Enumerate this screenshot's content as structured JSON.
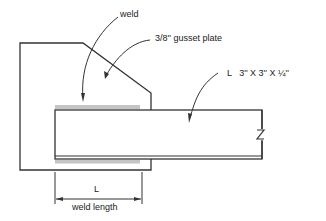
{
  "diagram": {
    "type": "engineering-detail",
    "labels": {
      "weld": "weld",
      "gusset_plate": "3/8'' gusset plate",
      "angle": "L   3'' X 3'' X ¼''",
      "dimension_symbol": "L",
      "dimension_caption": "weld length"
    },
    "symbols": {
      "break_mark": "Z"
    },
    "colors": {
      "line": "#333333",
      "weld_hatch": "#bdbdbd",
      "background": "#ffffff"
    }
  }
}
